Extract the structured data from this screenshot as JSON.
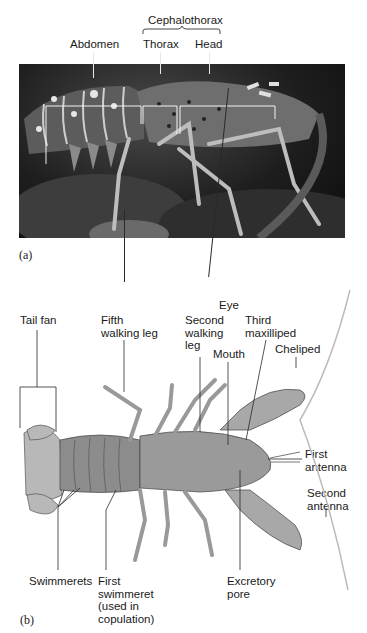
{
  "figure_a": {
    "panel_label": "(a)",
    "labels": {
      "cephalothorax": "Cephalothorax",
      "abdomen": "Abdomen",
      "thorax": "Thorax",
      "head": "Head",
      "fifth_walking_leg": "Fifth\nwalking leg",
      "eye": "Eye"
    }
  },
  "figure_b": {
    "panel_label": "(b)",
    "labels": {
      "tail_fan": "Tail fan",
      "second_walking_leg": "Second\nwalking\nleg",
      "third_maxilliped": "Third\nmaxilliped",
      "mouth": "Mouth",
      "cheliped": "Cheliped",
      "first_antenna": "First\nantenna",
      "second_antenna": "Second\nantenna",
      "swimmerets": "Swimmerets",
      "first_swimmeret": "First\nswimmeret\n(used in\ncopulation)",
      "excretory_pore": "Excretory\npore"
    }
  }
}
